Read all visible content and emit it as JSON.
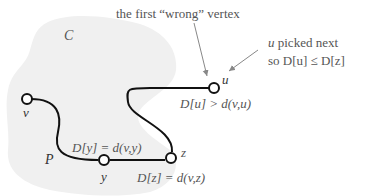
{
  "diagram": {
    "cloud_label": "C",
    "path_label": "P",
    "annotations": {
      "wrong_vertex": "the first “wrong” vertex",
      "picked_line1_var": "u",
      "picked_line1_rest": " picked next",
      "picked_line2": "so D[u] ≤ D[z]"
    },
    "nodes": [
      {
        "id": "v",
        "label": "v"
      },
      {
        "id": "y",
        "label": "y",
        "note": "D[y] = d(v,y)"
      },
      {
        "id": "z",
        "label": "z",
        "note": "D[z] = d(v,z)"
      },
      {
        "id": "u",
        "label": "u",
        "note": "D[u] > d(v,u)"
      }
    ],
    "colors": {
      "cloud": "#f0f0f0",
      "edge": "#111111",
      "text": "#555555",
      "arrow": "#888888"
    }
  }
}
